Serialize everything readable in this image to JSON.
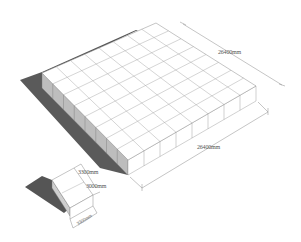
{
  "diagram": {
    "title": "",
    "large_block": {
      "grid_rows": 8,
      "grid_cols": 8,
      "dimension_depth_label": "26400mm",
      "dimension_width_label": "26400mm"
    },
    "unit_block": {
      "height_label": "3000mm",
      "top_width_label": "3300mm",
      "bottom_width_label": "3300mm"
    },
    "colors": {
      "background": "#ffffff",
      "face": "#ffffff",
      "grid_line": "#9a9a9a",
      "shadow": "#555555",
      "side_face": "#e6e6e6",
      "dimension_line": "#8a8a8a",
      "label_text": "#555555"
    }
  }
}
